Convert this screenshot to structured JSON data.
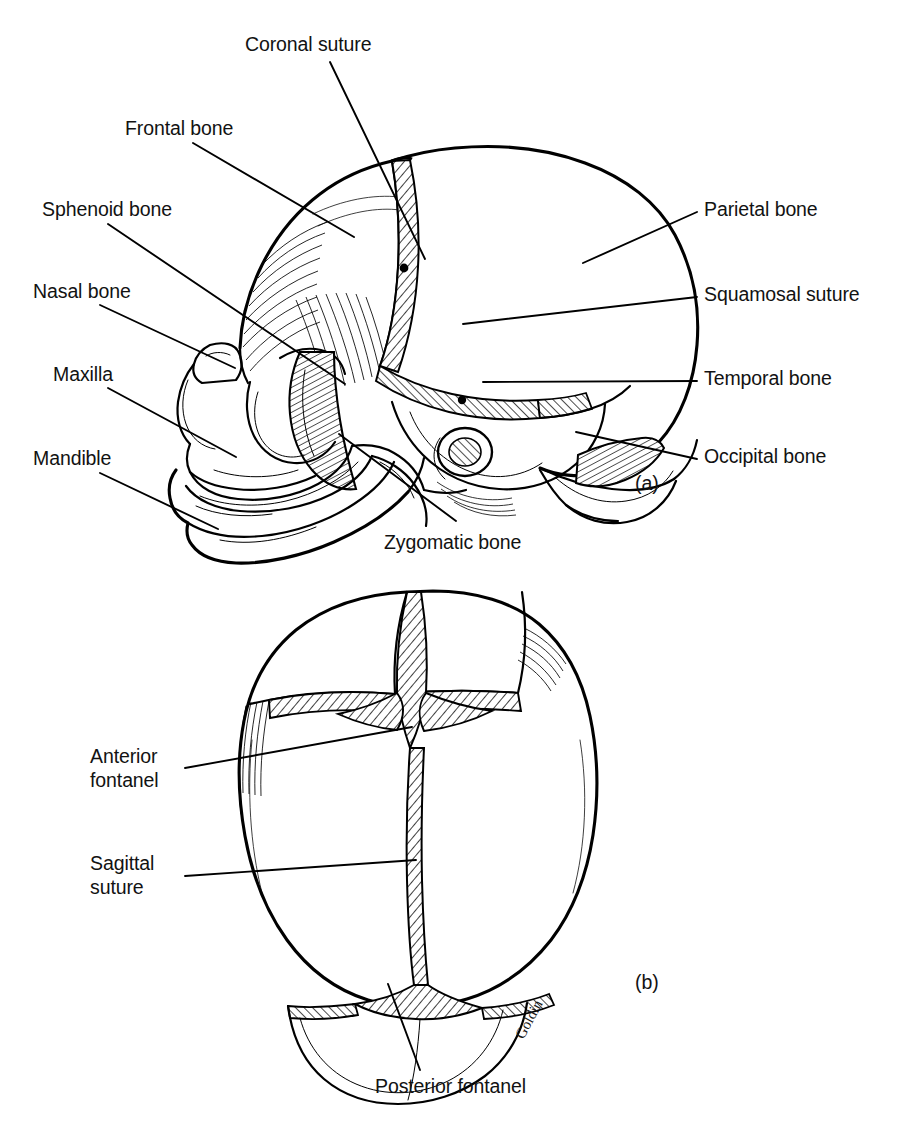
{
  "figure": {
    "background_color": "#ffffff",
    "ink_color": "#000000",
    "artist_signature": "Goldin"
  },
  "panels": [
    {
      "tag": "(a)",
      "view": "lateral view of infant skull",
      "labels": [
        {
          "id": "coronal-suture",
          "text": "Coronal suture",
          "side": "top"
        },
        {
          "id": "frontal-bone",
          "text": "Frontal bone",
          "side": "left"
        },
        {
          "id": "sphenoid-bone",
          "text": "Sphenoid bone",
          "side": "left"
        },
        {
          "id": "nasal-bone",
          "text": "Nasal bone",
          "side": "left"
        },
        {
          "id": "maxilla",
          "text": "Maxilla",
          "side": "left"
        },
        {
          "id": "mandible",
          "text": "Mandible",
          "side": "left"
        },
        {
          "id": "parietal-bone",
          "text": "Parietal bone",
          "side": "right"
        },
        {
          "id": "squamosal-suture",
          "text": "Squamosal suture",
          "side": "right"
        },
        {
          "id": "temporal-bone",
          "text": "Temporal bone",
          "side": "right"
        },
        {
          "id": "occipital-bone",
          "text": "Occipital bone",
          "side": "right"
        },
        {
          "id": "zygomatic-bone",
          "text": "Zygomatic bone",
          "side": "bottom"
        }
      ]
    },
    {
      "tag": "(b)",
      "view": "superior view of infant skull",
      "labels": [
        {
          "id": "anterior-fontanel",
          "text_line1": "Anterior",
          "text_line2": "fontanel",
          "side": "left"
        },
        {
          "id": "sagittal-suture",
          "text_line1": "Sagittal",
          "text_line2": "suture",
          "side": "left"
        },
        {
          "id": "posterior-fontanel",
          "text": "Posterior fontanel",
          "side": "bottom"
        }
      ]
    }
  ]
}
